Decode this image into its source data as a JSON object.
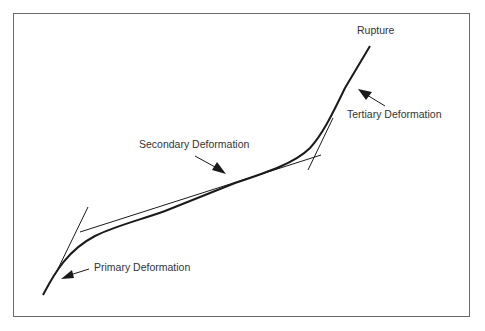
{
  "diagram": {
    "labels": {
      "rupture": "Rupture",
      "tertiary": "Tertiary Deformation",
      "secondary": "Secondary Deformation",
      "primary": "Primary Deformation"
    },
    "colors": {
      "line": "#1a1a1a",
      "border": "#6a6a6a",
      "text": "#333333",
      "background": "#ffffff"
    }
  }
}
